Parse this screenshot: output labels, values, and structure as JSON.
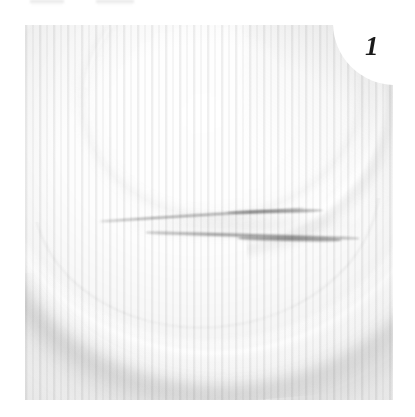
{
  "page": {
    "background_color": "#ffffff",
    "width": 415,
    "height": 417
  },
  "figure": {
    "number_label": "1",
    "number_color": "#1a1a1a",
    "caption": "",
    "photo": {
      "left": 25,
      "top": 25,
      "width": 368,
      "height": 375,
      "description": "Severely overexposed close-up photograph of a white plate or shallow dish resting on a pale surface",
      "dominant_tone": "#f7f7f7",
      "exposure": "overexposed / washed out",
      "print_artifact": "fine vertical halftone striping"
    },
    "subjects": [
      {
        "name": "plate-body",
        "label": "White plate",
        "tone": "#fdfdfd"
      },
      {
        "name": "rim-ring",
        "label": "Raised elliptical rim ring of the plate",
        "tone": "#f6f6f6"
      },
      {
        "name": "rim-highlight",
        "label": "Bright specular crescent on the rim",
        "tone": "#ffffff"
      },
      {
        "name": "plate-edge-highlight",
        "label": "Bright curved plate edge arc",
        "tone": "#ffffff"
      },
      {
        "name": "plate-shadow",
        "label": "Soft gray contact shadow beneath the plate edge",
        "tone": "#969696"
      },
      {
        "name": "dark-streaks",
        "label": "Two thin dark elongated streaks lying across the plate",
        "tone": "#6c6c6c",
        "count": 2
      }
    ]
  }
}
